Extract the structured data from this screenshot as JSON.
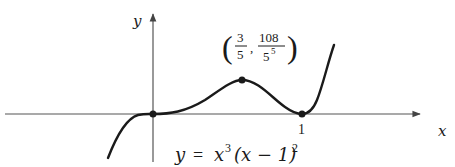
{
  "figure": {
    "axes": {
      "x_label": "x",
      "y_label": "y",
      "x_tick_label": "1"
    },
    "curve": {
      "equation_lhs": "y",
      "equation_eq": "=",
      "equation_x": "x",
      "equation_exp1": "3",
      "equation_factor": "(x − 1)",
      "equation_exp2": "2"
    },
    "annotation": {
      "max_point_x_num": "3",
      "max_point_x_den": "5",
      "max_point_y_num": "108",
      "max_point_y_den_base": "5",
      "max_point_y_den_exp": "5"
    },
    "points": [
      {
        "name": "origin",
        "x": 0,
        "y": 0
      },
      {
        "name": "local-max",
        "x": 0.6,
        "y": 0.03456
      },
      {
        "name": "root-1",
        "x": 1,
        "y": 0
      }
    ],
    "colors": {
      "ink": "#1a1a1a",
      "axis": "#555555"
    }
  }
}
